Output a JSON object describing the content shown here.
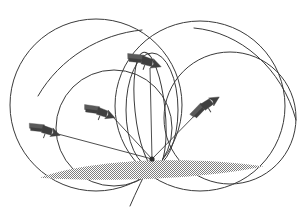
{
  "figure": {
    "background_color": "#ffffff",
    "stroke_color": "#3a3a3a",
    "satellite_body_color": "#3f3f3f",
    "satellite_panel_color": "#5a5a5a",
    "ground_shade_color": "#8c8c8c",
    "width": 304,
    "height": 211
  },
  "ground_station": {
    "label": "ground-station",
    "x": 152,
    "y": 159
  },
  "ground_footprint": {
    "label": "ground coverage ellipse",
    "fill_pattern": "halftone-dots",
    "center_x": 152,
    "center_y": 170,
    "radius_x": 112,
    "radius_y": 14,
    "color": "#8c8c8c"
  },
  "satellites": [
    {
      "name": "satellite-top",
      "x": 148,
      "y": 62,
      "heading_deg": 20,
      "scale": 1.0
    },
    {
      "name": "satellite-left-upper",
      "x": 103,
      "y": 113,
      "heading_deg": 22,
      "scale": 0.92
    },
    {
      "name": "satellite-left-lower",
      "x": 48,
      "y": 131,
      "heading_deg": 20,
      "scale": 0.92
    },
    {
      "name": "satellite-right",
      "x": 208,
      "y": 104,
      "heading_deg": -32,
      "scale": 0.95
    }
  ],
  "orbits": [
    {
      "name": "orbit-large-left",
      "cx": 96,
      "cy": 105,
      "rx": 86,
      "ry": 86,
      "rotation": 0,
      "stroke": "#3a3a3a",
      "stroke_width": 1.0
    },
    {
      "name": "orbit-large-right",
      "cx": 200,
      "cy": 106,
      "rx": 85,
      "ry": 85,
      "rotation": 0,
      "stroke": "#3a3a3a",
      "stroke_width": 1.0
    },
    {
      "name": "orbit-mid-left",
      "cx": 114,
      "cy": 128,
      "rx": 58,
      "ry": 58,
      "rotation": 0,
      "stroke": "#3a3a3a",
      "stroke_width": 1.0
    },
    {
      "name": "orbit-mid-right",
      "cx": 230,
      "cy": 118,
      "rx": 66,
      "ry": 66,
      "rotation": 0,
      "stroke": "#3a3a3a",
      "stroke_width": 1.0
    },
    {
      "name": "orbit-narrow-vertical",
      "cx": 152,
      "cy": 110,
      "rx": 26,
      "ry": 57,
      "rotation": 0,
      "stroke": "#3a3a3a",
      "stroke_width": 1.0
    },
    {
      "name": "orbit-narrow-tilted",
      "cx": 150,
      "cy": 110,
      "rx": 15,
      "ry": 58,
      "rotation": -6,
      "stroke": "#3a3a3a",
      "stroke_width": 1.0
    }
  ],
  "open_arcs": [
    {
      "name": "arc-upper-left-sweep",
      "path": "M 38 96 C 60 58 100 34 142 30",
      "stroke": "#3a3a3a",
      "stroke_width": 1.0
    },
    {
      "name": "arc-upper-right-sweep",
      "path": "M 194 28 C 240 32 282 68 296 120",
      "stroke": "#3a3a3a",
      "stroke_width": 1.0
    },
    {
      "name": "arc-lower-left-tail",
      "path": "M 152 159 C 144 176 136 192 130 206",
      "stroke": "#3a3a3a",
      "stroke_width": 1.0
    }
  ],
  "sight_lines": [
    {
      "name": "sight-line-to-satellite-top",
      "x1": 152,
      "y1": 159,
      "x2": 150,
      "y2": 68
    },
    {
      "name": "sight-line-to-satellite-left-upper",
      "x1": 152,
      "y1": 159,
      "x2": 113,
      "y2": 117
    },
    {
      "name": "sight-line-to-satellite-left-lower",
      "x1": 152,
      "y1": 159,
      "x2": 58,
      "y2": 134
    },
    {
      "name": "sight-line-to-satellite-right",
      "x1": 152,
      "y1": 159,
      "x2": 200,
      "y2": 110
    }
  ],
  "legend": {
    "caption": ""
  }
}
